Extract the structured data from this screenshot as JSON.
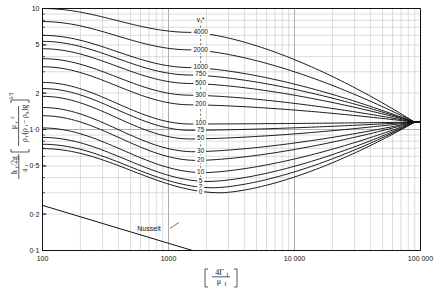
{
  "chart_data": {
    "type": "line",
    "title": "",
    "xlabel": "[ 4Γ_f / μ_f ]",
    "ylabel": "(h_f/2g) / a_f · [ μ_f² / ( ρ_f(ρ_f - ρ_g) g ) ]^(1/3)",
    "xscale": "log",
    "yscale": "log",
    "xlim": [
      100,
      100000
    ],
    "ylim": [
      0.1,
      10
    ],
    "grid": true,
    "grid_style": "log-minor",
    "legend_position": "inline-curve-labels",
    "series_param_symbol": "v₁*",
    "xticks": [
      100,
      1000,
      10000,
      100000
    ],
    "xtick_labels": [
      "100",
      "1000",
      "10 000",
      "100 000"
    ],
    "yticks": [
      0.1,
      0.2,
      0.5,
      1.0,
      2,
      5,
      10
    ],
    "ytick_labels": [
      "0·1",
      "0·2",
      "0·5",
      "1·0",
      "2",
      "5",
      "10"
    ],
    "convergence_point": {
      "x": 90000,
      "y": 1.15
    },
    "annotations": [
      {
        "text": "Nusselt",
        "x": 700,
        "y": 0.145,
        "type": "leader-label"
      }
    ],
    "series": [
      {
        "name": "4000",
        "label": "4000",
        "label_x": 1800,
        "y_left": 10.0,
        "y_min": 6.35,
        "x_min": 1500,
        "y_at_label": 6.45
      },
      {
        "name": "2000",
        "label": "2000",
        "label_x": 1800,
        "y_left": 7.8,
        "y_min": 4.55,
        "x_min": 1500,
        "y_at_label": 4.6
      },
      {
        "name": "1000",
        "label": "1000",
        "label_x": 1800,
        "y_left": 6.0,
        "y_min": 3.25,
        "x_min": 1500,
        "y_at_label": 3.3
      },
      {
        "name": "750",
        "label": "750",
        "label_x": 1800,
        "y_left": 5.35,
        "y_min": 2.82,
        "x_min": 1500,
        "y_at_label": 2.86
      },
      {
        "name": "500",
        "label": "500",
        "label_x": 1800,
        "y_left": 4.65,
        "y_min": 2.4,
        "x_min": 1500,
        "y_at_label": 2.44
      },
      {
        "name": "300",
        "label": "300",
        "label_x": 1800,
        "y_left": 3.85,
        "y_min": 1.92,
        "x_min": 1500,
        "y_at_label": 1.95
      },
      {
        "name": "200",
        "label": "200",
        "label_x": 1800,
        "y_left": 3.3,
        "y_min": 1.6,
        "x_min": 1500,
        "y_at_label": 1.63
      },
      {
        "name": "100",
        "label": "100",
        "label_x": 1800,
        "y_left": 2.45,
        "y_min": 1.11,
        "x_min": 1500,
        "y_at_label": 1.13
      },
      {
        "name": "75",
        "label": "75",
        "label_x": 1800,
        "y_left": 2.18,
        "y_min": 0.985,
        "x_min": 1500,
        "y_at_label": 1.0
      },
      {
        "name": "50",
        "label": "50",
        "label_x": 1800,
        "y_left": 1.88,
        "y_min": 0.835,
        "x_min": 1500,
        "y_at_label": 0.85
      },
      {
        "name": "30",
        "label": "30",
        "label_x": 1800,
        "y_left": 1.52,
        "y_min": 0.655,
        "x_min": 1600,
        "y_at_label": 0.665
      },
      {
        "name": "20",
        "label": "20",
        "label_x": 1800,
        "y_left": 1.3,
        "y_min": 0.555,
        "x_min": 1700,
        "y_at_label": 0.565
      },
      {
        "name": "10",
        "label": "10",
        "label_x": 1800,
        "y_left": 1.03,
        "y_min": 0.44,
        "x_min": 1900,
        "y_at_label": 0.447
      },
      {
        "name": "5",
        "label": "5",
        "label_x": 1800,
        "y_left": 0.86,
        "y_min": 0.372,
        "x_min": 2100,
        "y_at_label": 0.379
      },
      {
        "name": "2",
        "label": "2",
        "label_x": 1800,
        "y_left": 0.755,
        "y_min": 0.33,
        "x_min": 2300,
        "y_at_label": 0.337
      },
      {
        "name": "0",
        "label": "0",
        "label_x": 1800,
        "y_left": 0.695,
        "y_min": 0.3,
        "x_min": 2600,
        "y_at_label": 0.307
      }
    ],
    "nusselt_line": {
      "name": "Nusselt",
      "type": "straight-log-log",
      "points": [
        [
          100,
          0.236
        ],
        [
          1550,
          0.1
        ]
      ],
      "slope": -0.313
    }
  },
  "axis_label_x": {
    "numerator": "4Γ",
    "numerator_sub": "f",
    "denominator": "μ",
    "denominator_sub": "f"
  },
  "axis_label_y": {
    "lead_num": "h",
    "lead_num_sub": "f",
    "lead_num_rest": "/2g",
    "lead_den": "a",
    "lead_den_sub": "f",
    "brk_num": "μ",
    "brk_num_sub": "f",
    "brk_num_sup": "2",
    "brk_den": "ρ",
    "brk_den_sub": "f",
    "brk_den_rest": "(ρ",
    "brk_den_sub2": "f",
    "brk_den_rest2": " − ρ",
    "brk_den_sub3": "g",
    "brk_den_rest3": ")g",
    "exponent": "1/3"
  },
  "curve_param_header": "v₁*",
  "colors": {
    "ink": "#111111",
    "grid": "#9a9a9a",
    "grid_minor": "#b8b8b8",
    "background": "#ffffff"
  }
}
